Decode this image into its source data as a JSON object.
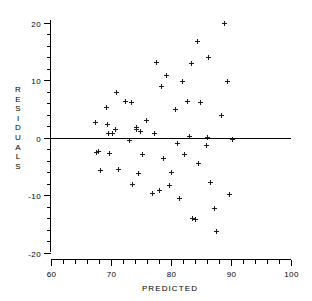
{
  "chart_data": {
    "type": "scatter",
    "title": "",
    "xlabel": "PREDICTED",
    "ylabel": "RESIDUALS",
    "xlim": [
      60,
      100
    ],
    "ylim": [
      -20,
      20
    ],
    "xticks": [
      60,
      70,
      80,
      90,
      100
    ],
    "xtick_labels": [
      "60",
      "70",
      "80",
      "90",
      "100"
    ],
    "yticks": [
      -20,
      -10,
      0,
      10,
      20
    ],
    "ytick_labels": [
      "-20",
      "-10",
      "0",
      "10",
      "20"
    ],
    "x_minor_tick_step": 2,
    "y_minor_tick_step": 2,
    "grid": false,
    "legend": null,
    "marker": "plus",
    "marker_color": "#1a1a1a",
    "reference_lines": [
      {
        "orientation": "horizontal",
        "value": 0,
        "color": "#000000"
      }
    ],
    "series": [
      {
        "name": "residuals",
        "points": [
          [
            67.4,
            2.7
          ],
          [
            67.5,
            -2.6
          ],
          [
            67.9,
            -2.4
          ],
          [
            68.3,
            -5.7
          ],
          [
            69.3,
            5.3
          ],
          [
            69.4,
            2.3
          ],
          [
            69.5,
            0.7
          ],
          [
            69.8,
            -2.7
          ],
          [
            70.3,
            0.8
          ],
          [
            70.8,
            1.4
          ],
          [
            70.9,
            7.9
          ],
          [
            71.2,
            -5.4
          ],
          [
            72.4,
            6.3
          ],
          [
            73.1,
            -0.4
          ],
          [
            73.4,
            6.1
          ],
          [
            73.6,
            -8.0
          ],
          [
            74.2,
            1.8
          ],
          [
            74.3,
            1.5
          ],
          [
            74.5,
            -6.2
          ],
          [
            74.9,
            1.1
          ],
          [
            75.2,
            -2.9
          ],
          [
            75.9,
            3.1
          ],
          [
            76.9,
            -9.6
          ],
          [
            77.2,
            0.7
          ],
          [
            77.5,
            13.1
          ],
          [
            78.0,
            -9.2
          ],
          [
            78.4,
            8.9
          ],
          [
            78.8,
            -3.6
          ],
          [
            79.2,
            10.8
          ],
          [
            79.8,
            -8.3
          ],
          [
            80.1,
            -6.0
          ],
          [
            80.7,
            4.9
          ],
          [
            81.0,
            -1.0
          ],
          [
            81.4,
            -10.6
          ],
          [
            81.9,
            9.9
          ],
          [
            82.2,
            -2.8
          ],
          [
            82.8,
            6.4
          ],
          [
            83.1,
            0.3
          ],
          [
            83.4,
            12.9
          ],
          [
            83.6,
            -14.0
          ],
          [
            84.1,
            -14.2
          ],
          [
            84.4,
            16.7
          ],
          [
            84.6,
            -4.5
          ],
          [
            84.9,
            6.1
          ],
          [
            85.9,
            -1.3
          ],
          [
            86.0,
            0.1
          ],
          [
            86.2,
            14.0
          ],
          [
            86.5,
            -7.8
          ],
          [
            87.2,
            -12.3
          ],
          [
            87.6,
            -16.3
          ],
          [
            88.4,
            3.9
          ],
          [
            88.9,
            20.0
          ],
          [
            89.4,
            9.9
          ],
          [
            89.8,
            -9.8
          ],
          [
            90.3,
            -0.2
          ]
        ]
      }
    ]
  },
  "axes": {
    "y_label_chars": [
      "R",
      "E",
      "S",
      "I",
      "D",
      "U",
      "A",
      "L",
      "S"
    ]
  }
}
